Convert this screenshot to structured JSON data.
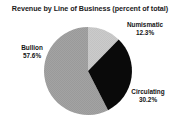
{
  "chart_data": {
    "type": "pie",
    "title": "Revenue by Line of Business (percent of total)",
    "subtitle": "",
    "xlabel": "",
    "ylabel": "",
    "grid": false,
    "legend": "none",
    "labels_position": "outside",
    "categories": [
      "Numismatic",
      "Circulating",
      "Bullion"
    ],
    "values": [
      12.3,
      30.2,
      57.6
    ],
    "value_suffix": "%",
    "start_angle_deg": 0,
    "direction": "clockwise",
    "slices": [
      {
        "name": "Numismatic",
        "value": 12.3,
        "value_label": "12.3%",
        "color": "#c9c9c9",
        "start_deg": 0.0,
        "end_deg": 44.28
      },
      {
        "name": "Circulating",
        "value": 30.2,
        "value_label": "30.2%",
        "color": "#0a0a0a",
        "start_deg": 44.28,
        "end_deg": 153.0
      },
      {
        "name": "Bullion",
        "value": 57.6,
        "value_label": "57.6%",
        "color": "#a0a0a0",
        "start_deg": 153.0,
        "end_deg": 360.0
      }
    ]
  },
  "chart": {
    "title": "Revenue by Line of Business (percent of total)",
    "labels": {
      "numismatic": {
        "name": "Numismatic",
        "percent": "12.3%"
      },
      "bullion": {
        "name": "Bullion",
        "percent": "57.6%"
      },
      "circulating": {
        "name": "Circulating",
        "percent": "30.2%"
      }
    }
  },
  "colors": {
    "numismatic": "#c9c9c9",
    "circulating": "#0a0a0a",
    "bullion": "#a0a0a0",
    "text": "#141414",
    "background": "#ffffff"
  }
}
